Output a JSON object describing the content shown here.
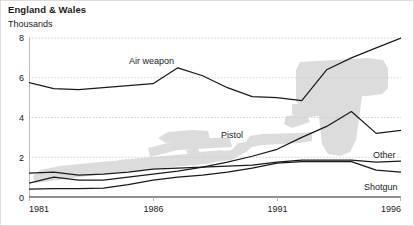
{
  "header": {
    "title": "England & Wales",
    "subtitle": "Thousands"
  },
  "chart_data": {
    "type": "line",
    "title": "England & Wales",
    "subtitle": "Thousands",
    "xlabel": "",
    "ylabel": "Thousands",
    "xlim": [
      1981,
      1996
    ],
    "ylim": [
      0,
      8
    ],
    "grid": true,
    "legend_position": "inline-labels",
    "x": [
      1981,
      1982,
      1983,
      1984,
      1985,
      1986,
      1987,
      1988,
      1989,
      1990,
      1991,
      1992,
      1993,
      1994,
      1995,
      1996
    ],
    "x_ticks": [
      1981,
      1986,
      1991,
      1996
    ],
    "x_tick_labels": [
      "1981",
      "1986",
      "1991",
      "1996"
    ],
    "y_ticks": [
      0,
      2,
      4,
      6,
      8
    ],
    "y_tick_labels": [
      "0",
      "2",
      "4",
      "6",
      "8"
    ],
    "series": [
      {
        "name": "Air weapon",
        "label": "Air weapon",
        "values": [
          5.75,
          5.45,
          5.4,
          5.5,
          5.6,
          5.7,
          6.5,
          6.1,
          5.5,
          5.05,
          5.0,
          4.85,
          6.4,
          7.0,
          7.5,
          8.0
        ]
      },
      {
        "name": "Pistol",
        "label": "Pistol",
        "values": [
          0.7,
          1.0,
          0.85,
          0.85,
          1.0,
          1.15,
          1.3,
          1.5,
          1.75,
          2.05,
          2.4,
          3.0,
          3.55,
          4.3,
          3.2,
          3.35
        ]
      },
      {
        "name": "Other",
        "label": "Other",
        "values": [
          1.2,
          1.25,
          1.1,
          1.15,
          1.25,
          1.4,
          1.45,
          1.5,
          1.55,
          1.6,
          1.75,
          1.85,
          1.85,
          1.85,
          1.75,
          1.8
        ]
      },
      {
        "name": "Shotgun",
        "label": "Shotgun",
        "values": [
          0.4,
          0.42,
          0.42,
          0.45,
          0.62,
          0.85,
          1.0,
          1.1,
          1.25,
          1.45,
          1.7,
          1.78,
          1.78,
          1.78,
          1.35,
          1.25
        ]
      }
    ],
    "annotations": [
      {
        "text": "Air weapon",
        "x": 1986.6,
        "y": 6.85
      },
      {
        "text": "Pistol",
        "x": 1990.1,
        "y": 3.1
      },
      {
        "text": "Other",
        "x": 1994.9,
        "y": 2.15
      },
      {
        "text": "Shotgun",
        "x": 1994.9,
        "y": 0.75
      }
    ],
    "watermarks": [
      {
        "name": "rifle-watermark",
        "color": "#dcdcdc"
      },
      {
        "name": "pistol-watermark",
        "color": "#dcdcdc"
      }
    ],
    "colors": {
      "line": "#1a1a1a",
      "grid": "#c8c8c8",
      "axis": "#222222",
      "watermark": "#dcdcdc",
      "background": "#ffffff"
    }
  }
}
